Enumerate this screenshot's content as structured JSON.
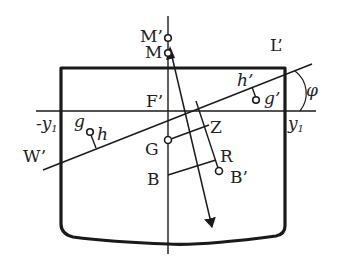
{
  "diagram": {
    "colors": {
      "stroke": "#1a1a1a",
      "text": "#222222",
      "background": "#ffffff"
    },
    "labels": {
      "M_prime": "M’",
      "M": "M",
      "L_prime": "L’",
      "F_prime": "F’",
      "phi": "φ",
      "h_prime": "h’",
      "g_prime": "g’",
      "neg_y1_prefix": "-y",
      "neg_y1_sub": "1",
      "y1": "y",
      "y1_sub": "1",
      "g": "g",
      "h": "h",
      "W_prime": "W’",
      "Z": "Z",
      "G": "G",
      "R": "R",
      "B": "B",
      "B_prime": "B’"
    },
    "elements": [
      "hull-outline",
      "waterline-upright",
      "waterline-heeled",
      "centerline",
      "buoyancy-force-arrow",
      "righting-arm-GZ",
      "heel-angle-arc"
    ]
  }
}
